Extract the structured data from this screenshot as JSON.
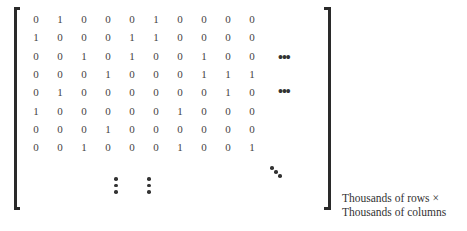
{
  "matrix": {
    "rows": [
      [
        0,
        1,
        0,
        0,
        0,
        1,
        0,
        0,
        0,
        0
      ],
      [
        1,
        0,
        0,
        0,
        1,
        1,
        0,
        0,
        0,
        0
      ],
      [
        0,
        0,
        1,
        0,
        1,
        0,
        0,
        1,
        0,
        0
      ],
      [
        0,
        0,
        0,
        1,
        0,
        0,
        0,
        1,
        1,
        1
      ],
      [
        0,
        1,
        0,
        0,
        0,
        0,
        0,
        0,
        1,
        0
      ],
      [
        1,
        0,
        0,
        0,
        0,
        0,
        1,
        0,
        0,
        0
      ],
      [
        0,
        0,
        0,
        1,
        0,
        0,
        0,
        0,
        0,
        0
      ],
      [
        0,
        0,
        1,
        0,
        0,
        0,
        1,
        0,
        0,
        1
      ]
    ],
    "horizontal_ellipsis": "•••",
    "row_count_shown": 8,
    "column_count_shown": 10
  },
  "caption": {
    "line1": "Thousands of rows ×",
    "line2": "Thousands of columns"
  }
}
